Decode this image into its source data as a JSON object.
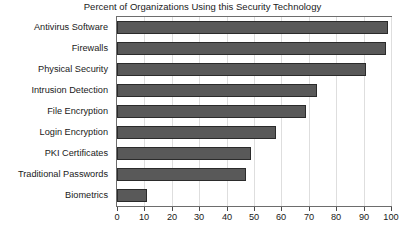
{
  "chart_data": {
    "type": "bar",
    "orientation": "horizontal",
    "title": "Percent of Organizations Using this Security Technology",
    "xlabel": "",
    "ylabel": "",
    "categories": [
      "Antivirus Software",
      "Firewalls",
      "Physical Security",
      "Intrusion Detection",
      "File Encryption",
      "Login Encryption",
      "PKI Certificates",
      "Traditional Passwords",
      "Biometrics"
    ],
    "values": [
      99,
      98,
      91,
      73,
      69,
      58,
      49,
      47,
      11
    ],
    "xlim": [
      0,
      100
    ],
    "xticks": [
      0,
      10,
      20,
      30,
      40,
      50,
      60,
      70,
      80,
      90,
      100
    ],
    "xtick_labels": [
      "0",
      "10",
      "20",
      "30",
      "40",
      "50",
      "60",
      "70",
      "80",
      "90",
      "100"
    ],
    "grid": "vertical",
    "legend": "none",
    "bar_color": "#595959",
    "bar_border_color": "#2b2b2b",
    "gridline_color": "#dedede",
    "axis_color": "#6d6d6d",
    "text_color": "#1a1a1a",
    "background_color": "#ffffff"
  }
}
